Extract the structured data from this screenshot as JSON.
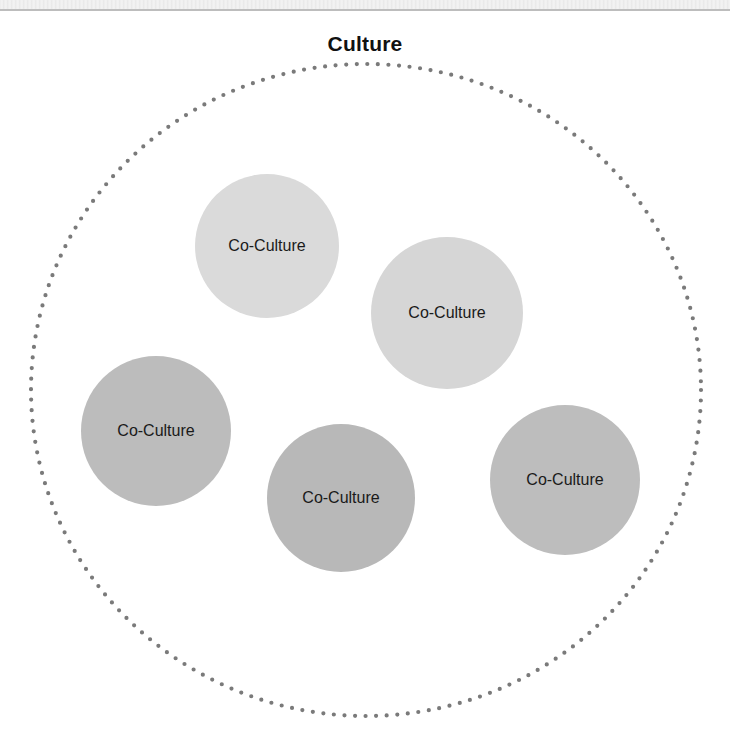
{
  "diagram": {
    "title": "Culture",
    "outer_boundary": {
      "label": "Culture",
      "cx": 366,
      "cy": 390,
      "rx": 335,
      "ry": 326,
      "stroke_color": "#7a7a7a",
      "style": "dotted"
    },
    "co_cultures": [
      {
        "label": "Co-Culture",
        "cx": 267,
        "cy": 246,
        "r": 72,
        "fill": "#dadada"
      },
      {
        "label": "Co-Culture",
        "cx": 447,
        "cy": 313,
        "r": 76,
        "fill": "#d6d6d6"
      },
      {
        "label": "Co-Culture",
        "cx": 156,
        "cy": 431,
        "r": 75,
        "fill": "#bcbcbc"
      },
      {
        "label": "Co-Culture",
        "cx": 341,
        "cy": 498,
        "r": 74,
        "fill": "#b8b8b8"
      },
      {
        "label": "Co-Culture",
        "cx": 565,
        "cy": 480,
        "r": 75,
        "fill": "#bdbdbd"
      }
    ]
  }
}
